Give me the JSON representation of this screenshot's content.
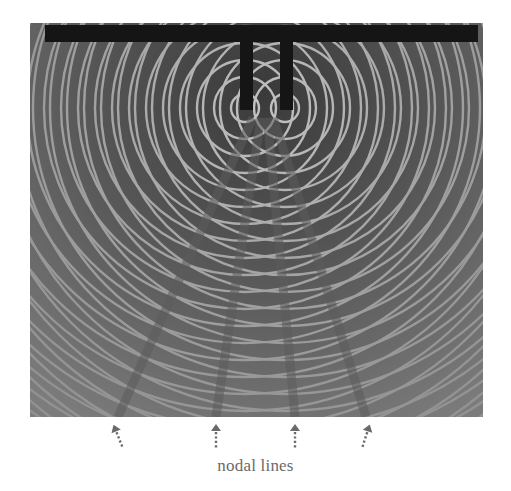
{
  "figure": {
    "caption": "nodal lines",
    "arrows": [
      {
        "x": 118,
        "tilt": -22
      },
      {
        "x": 216,
        "tilt": 0
      },
      {
        "x": 295,
        "tilt": 0
      },
      {
        "x": 366,
        "tilt": 18
      }
    ],
    "sources": [
      {
        "x": 245,
        "y": 108
      },
      {
        "x": 285,
        "y": 108
      }
    ],
    "colors": {
      "background": "#ffffff",
      "water": "#6e6e6e",
      "crest": "#e8e8e8",
      "trough": "#2a2a2a",
      "bar": "#151515",
      "caption": "#6a6a6a",
      "arrow": "#6a6a6a"
    }
  }
}
